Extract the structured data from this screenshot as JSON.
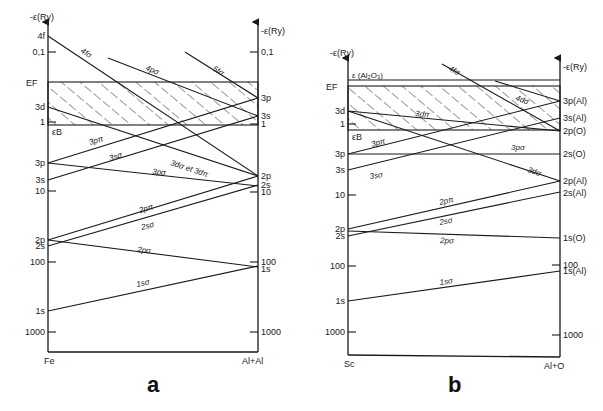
{
  "panels": [
    {
      "id": "a",
      "caption": "a",
      "axis_left": {
        "x": 48,
        "top": 22,
        "bottom": 352,
        "title": "-ε(Ry)",
        "bottom_label": "Fe"
      },
      "axis_right": {
        "x": 258,
        "top": 22,
        "bottom": 352,
        "title": "-ε(Ry)",
        "bottom_label": "Al+Al"
      },
      "fermi_band": {
        "y_top": 82,
        "y_bottom": 125,
        "top_label": "EF",
        "bottom_label": "εB"
      },
      "left_levels": [
        {
          "label": "4f",
          "y": 36
        },
        {
          "label": "0,1",
          "y": 52,
          "tick": true
        },
        {
          "label": "3d",
          "y": 107
        },
        {
          "label": "1",
          "y": 122,
          "tick": true
        },
        {
          "label": "3p",
          "y": 163
        },
        {
          "label": "3s",
          "y": 180
        },
        {
          "label": "10",
          "y": 191,
          "tick": true
        },
        {
          "label": "2p",
          "y": 240
        },
        {
          "label": "2s",
          "y": 246
        },
        {
          "label": "100",
          "y": 262,
          "tick": true
        },
        {
          "label": "1s",
          "y": 311
        },
        {
          "label": "1000",
          "y": 332,
          "tick": true
        }
      ],
      "right_levels": [
        {
          "label": "0,1",
          "y": 52,
          "tick": true
        },
        {
          "label": "3p",
          "y": 98
        },
        {
          "label": "3s",
          "y": 116
        },
        {
          "label": "1",
          "y": 124,
          "tick": true
        },
        {
          "label": "2p",
          "y": 176
        },
        {
          "label": "2s",
          "y": 185
        },
        {
          "label": "10",
          "y": 192,
          "tick": true
        },
        {
          "label": "100",
          "y": 262,
          "tick": true
        },
        {
          "label": "1s",
          "y": 269
        },
        {
          "label": "1000",
          "y": 332,
          "tick": true
        }
      ],
      "orbitals": [
        {
          "name": "4fσ",
          "x1": 48,
          "y1": 36,
          "x2": 258,
          "y2": 176,
          "lx": 80,
          "ly": 52,
          "rot": 33
        },
        {
          "name": "4pσ",
          "x1": 108,
          "y1": 58,
          "x2": 258,
          "y2": 116,
          "lx": 145,
          "ly": 70,
          "rot": 21
        },
        {
          "name": "5fσ",
          "x1": 185,
          "y1": 52,
          "x2": 258,
          "y2": 98,
          "lx": 212,
          "ly": 70,
          "rot": 32
        },
        {
          "name": "3dσ et 3dπ",
          "x1": 48,
          "y1": 107,
          "x2": 258,
          "y2": 176,
          "lx": 170,
          "ly": 165,
          "rot": 18
        },
        {
          "name": "3pπ",
          "x1": 48,
          "y1": 163,
          "x2": 258,
          "y2": 98,
          "lx": 90,
          "ly": 145,
          "rot": -17
        },
        {
          "name": "3sσ",
          "x1": 48,
          "y1": 180,
          "x2": 258,
          "y2": 116,
          "lx": 110,
          "ly": 161,
          "rot": -17
        },
        {
          "name": "3pσ",
          "x1": 48,
          "y1": 163,
          "x2": 258,
          "y2": 186,
          "lx": 152,
          "ly": 174,
          "rot": 6
        },
        {
          "name": "2pπ",
          "x1": 48,
          "y1": 240,
          "x2": 258,
          "y2": 176,
          "lx": 140,
          "ly": 213,
          "rot": -17
        },
        {
          "name": "2sσ",
          "x1": 48,
          "y1": 246,
          "x2": 258,
          "y2": 185,
          "lx": 142,
          "ly": 230,
          "rot": -16
        },
        {
          "name": "2pσ",
          "x1": 48,
          "y1": 240,
          "x2": 258,
          "y2": 267,
          "lx": 137,
          "ly": 252,
          "rot": 7
        },
        {
          "name": "1sσ",
          "x1": 48,
          "y1": 311,
          "x2": 258,
          "y2": 266,
          "lx": 137,
          "ly": 287,
          "rot": -12
        }
      ]
    },
    {
      "id": "b",
      "caption": "b",
      "axis_left": {
        "x": 348,
        "top": 58,
        "bottom": 355,
        "title": "-ε(Ry)",
        "bottom_label": "Sc"
      },
      "axis_right": {
        "x": 560,
        "top": 58,
        "bottom": 357,
        "title": "-ε(Ry)",
        "bottom_label": "Al+O"
      },
      "extra_line": {
        "y": 80,
        "label": "ε (Al₂O₃)"
      },
      "fermi_band": {
        "y_top": 86,
        "y_bottom": 130,
        "top_label": "EF",
        "bottom_label": "εB"
      },
      "left_levels": [
        {
          "label": "3d",
          "y": 111
        },
        {
          "label": "1",
          "y": 124,
          "tick": true
        },
        {
          "label": "3p",
          "y": 154
        },
        {
          "label": "3s",
          "y": 170
        },
        {
          "label": "10",
          "y": 195,
          "tick": true
        },
        {
          "label": "2p",
          "y": 229
        },
        {
          "label": "2s",
          "y": 236
        },
        {
          "label": "100",
          "y": 266,
          "tick": true
        },
        {
          "label": "1s",
          "y": 301
        },
        {
          "label": "1000",
          "y": 332,
          "tick": true
        }
      ],
      "right_levels": [
        {
          "label": "3p(Al)",
          "y": 101
        },
        {
          "label": "3s(Al)",
          "y": 118
        },
        {
          "label": "2p(O)",
          "y": 131
        },
        {
          "label": "2s(O)",
          "y": 154
        },
        {
          "label": "2p(Al)",
          "y": 181
        },
        {
          "label": "2s(Al)",
          "y": 193
        },
        {
          "label": "1s(O)",
          "y": 238
        },
        {
          "label": "100",
          "y": 265,
          "tick": true
        },
        {
          "label": "1s(Al)",
          "y": 271
        },
        {
          "label": "1000",
          "y": 335,
          "tick": true
        }
      ],
      "orbitals": [
        {
          "name": "4fσ",
          "x1": 442,
          "y1": 64,
          "x2": 560,
          "y2": 131,
          "lx": 448,
          "ly": 70,
          "rot": 30
        },
        {
          "name": "4dσ",
          "x1": 495,
          "y1": 81,
          "x2": 560,
          "y2": 101,
          "lx": 515,
          "ly": 100,
          "rot": 20
        },
        {
          "name": "3dπ",
          "x1": 348,
          "y1": 111,
          "x2": 560,
          "y2": 131,
          "lx": 415,
          "ly": 116,
          "rot": 5
        },
        {
          "name": "3dσ",
          "x1": 348,
          "y1": 111,
          "x2": 560,
          "y2": 181,
          "lx": 527,
          "ly": 172,
          "rot": 18
        },
        {
          "name": "3pπ",
          "x1": 348,
          "y1": 154,
          "x2": 560,
          "y2": 101,
          "lx": 372,
          "ly": 147,
          "rot": -15
        },
        {
          "name": "3sσ",
          "x1": 348,
          "y1": 170,
          "x2": 560,
          "y2": 118,
          "lx": 370,
          "ly": 179,
          "rot": -8
        },
        {
          "name": "3pσ",
          "x1": 348,
          "y1": 154,
          "x2": 560,
          "y2": 154,
          "lx": 511,
          "ly": 150,
          "rot": 0
        },
        {
          "name": "2pπ",
          "x1": 348,
          "y1": 229,
          "x2": 560,
          "y2": 181,
          "lx": 440,
          "ly": 205,
          "rot": -13
        },
        {
          "name": "2sσ",
          "x1": 348,
          "y1": 236,
          "x2": 560,
          "y2": 192,
          "lx": 440,
          "ly": 225,
          "rot": -11
        },
        {
          "name": "2pσ",
          "x1": 348,
          "y1": 231,
          "x2": 560,
          "y2": 238,
          "lx": 440,
          "ly": 243,
          "rot": 2
        },
        {
          "name": "1sσ",
          "x1": 348,
          "y1": 301,
          "x2": 560,
          "y2": 271,
          "lx": 440,
          "ly": 285,
          "rot": -8
        }
      ]
    }
  ]
}
